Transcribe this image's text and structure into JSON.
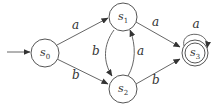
{
  "diagram": {
    "type": "finite-automaton",
    "start_state": "s0",
    "states": [
      {
        "id": "s0",
        "label": "s",
        "subscript": "0",
        "accepting": false
      },
      {
        "id": "s1",
        "label": "s",
        "subscript": "1",
        "accepting": false
      },
      {
        "id": "s2",
        "label": "s",
        "subscript": "2",
        "accepting": false
      },
      {
        "id": "s3",
        "label": "s",
        "subscript": "3",
        "accepting": true
      }
    ],
    "transitions": [
      {
        "from": "s0",
        "to": "s1",
        "label": "a"
      },
      {
        "from": "s0",
        "to": "s2",
        "label": "b"
      },
      {
        "from": "s1",
        "to": "s2",
        "label": "b"
      },
      {
        "from": "s2",
        "to": "s1",
        "label": "a"
      },
      {
        "from": "s1",
        "to": "s3",
        "label": "a"
      },
      {
        "from": "s2",
        "to": "s3",
        "label": "b"
      },
      {
        "from": "s3",
        "to": "s3",
        "label": "a"
      }
    ]
  }
}
